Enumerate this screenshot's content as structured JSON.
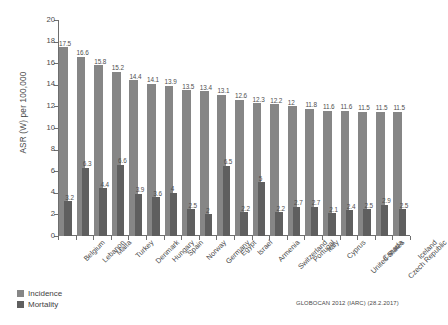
{
  "chart_data": {
    "type": "bar",
    "title": "",
    "subtitle": "",
    "xlabel": "",
    "ylabel": "ASR (W) per 100,000",
    "ylim": [
      0,
      20
    ],
    "ytick_step": 2,
    "yticks": [
      "0",
      "2",
      "4",
      "6",
      "8",
      "10",
      "12",
      "14",
      "16",
      "18",
      "20"
    ],
    "grid": false,
    "legend_position": "bottom-left",
    "categories": [
      "Belgium",
      "Lebanon",
      "Malta",
      "Turkey",
      "Denmark",
      "Hungary",
      "Spain",
      "Norway",
      "Germany",
      "Egypt",
      "Israel",
      "Armenia",
      "Switzerland",
      "Portugal",
      "Italy",
      "Cyprus",
      "United States",
      "Canada",
      "Czech Republic",
      "Iceland"
    ],
    "series": [
      {
        "name": "Incidence",
        "color": "#868686",
        "values": [
          17.5,
          16.6,
          15.8,
          15.2,
          14.4,
          14.1,
          13.9,
          13.5,
          13.4,
          13.1,
          12.6,
          12.3,
          12.2,
          12,
          11.8,
          11.6,
          11.6,
          11.5,
          11.5,
          11.5
        ],
        "labels": [
          "17.5",
          "16.6",
          "15.8",
          "15.2",
          "14.4",
          "14.1",
          "13.9",
          "13.5",
          "13.4",
          "13.1",
          "12.6",
          "12.3",
          "12.2",
          "12",
          "11.8",
          "11.6",
          "11.6",
          "11.5",
          "11.5",
          "11.5"
        ]
      },
      {
        "name": "Mortality",
        "color": "#5f5f5f",
        "values": [
          3.2,
          6.3,
          4.4,
          6.6,
          3.9,
          3.6,
          4,
          2.5,
          2,
          6.5,
          2.2,
          5,
          2.2,
          2.7,
          2.7,
          2.1,
          2.4,
          2.5,
          2.9,
          2.5
        ],
        "labels": [
          "3.2",
          "6.3",
          "4.4",
          "6.6",
          "3.9",
          "3.6",
          "4",
          "2.5",
          "2",
          "6.5",
          "2.2",
          "5",
          "2.2",
          "2.7",
          "2.7",
          "2.1",
          "2.4",
          "2.5",
          "2.9",
          "2.5"
        ]
      }
    ],
    "source_note": "GLOBOCAN 2012 (IARC) (28.2.2017)"
  },
  "legend": {
    "incidence_label": "Incidence",
    "mortality_label": "Mortality"
  }
}
